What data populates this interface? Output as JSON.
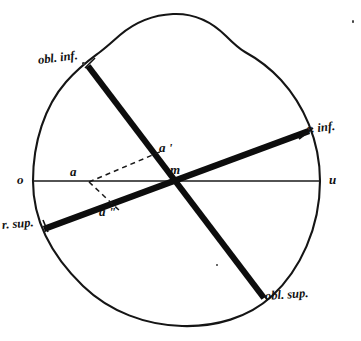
{
  "figure": {
    "shape_outline": "lobed circle",
    "axis_line": {
      "left_label": "o",
      "right_label": "u"
    },
    "points": {
      "center": "m",
      "a": "a",
      "a_prime": "a '",
      "a_double_prime": "a \""
    },
    "muscle_labels": {
      "obliquus_inferior": "obl. inf.",
      "rectus_inferior": "r. inf.",
      "rectus_superior": "r. sup.",
      "obliquus_superior": "obl. sup."
    },
    "colors": {
      "ink": "#111111",
      "outline": "#151515",
      "paper": "#ffffff"
    }
  }
}
